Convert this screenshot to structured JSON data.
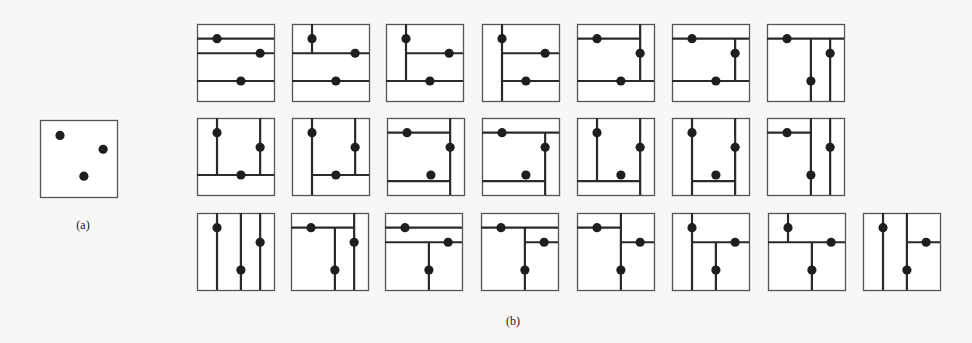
{
  "figure": {
    "panel_a": {
      "label": "(a)",
      "box": {
        "x": 40,
        "y": 120,
        "size": 77
      },
      "points": [
        [
          0.26,
          0.2
        ],
        [
          0.82,
          0.38
        ],
        [
          0.57,
          0.73
        ]
      ]
    },
    "panel_b": {
      "label": "(b)",
      "box_size": 77,
      "points": [
        [
          0.26,
          0.19
        ],
        [
          0.82,
          0.38
        ],
        [
          0.57,
          0.74
        ]
      ],
      "partitions": [
        {
          "x": 197,
          "y": 24,
          "lines": [
            [
              "h",
              0.19,
              0,
              1
            ],
            [
              "h",
              0.38,
              0,
              1
            ],
            [
              "h",
              0.74,
              0,
              1
            ]
          ]
        },
        {
          "x": 292,
          "y": 24,
          "lines": [
            [
              "v",
              0.26,
              0,
              0.38
            ],
            [
              "h",
              0.38,
              0,
              1
            ],
            [
              "h",
              0.74,
              0,
              1
            ]
          ]
        },
        {
          "x": 386,
          "y": 24,
          "lines": [
            [
              "v",
              0.26,
              0,
              0.74
            ],
            [
              "h",
              0.38,
              0.26,
              1
            ],
            [
              "h",
              0.74,
              0,
              1
            ]
          ]
        },
        {
          "x": 482,
          "y": 24,
          "lines": [
            [
              "v",
              0.26,
              0,
              1
            ],
            [
              "h",
              0.38,
              0.26,
              1
            ],
            [
              "h",
              0.74,
              0.26,
              1
            ]
          ]
        },
        {
          "x": 577,
          "y": 24,
          "lines": [
            [
              "h",
              0.19,
              0,
              0.82
            ],
            [
              "v",
              0.82,
              0,
              0.74
            ],
            [
              "h",
              0.74,
              0,
              1
            ]
          ]
        },
        {
          "x": 672,
          "y": 24,
          "lines": [
            [
              "h",
              0.19,
              0,
              1
            ],
            [
              "v",
              0.82,
              0.19,
              0.74
            ],
            [
              "h",
              0.74,
              0,
              1
            ]
          ]
        },
        {
          "x": 767,
          "y": 24,
          "lines": [
            [
              "h",
              0.19,
              0,
              1
            ],
            [
              "v",
              0.57,
              0.19,
              1
            ],
            [
              "v",
              0.82,
              0.19,
              1
            ]
          ]
        },
        {
          "x": 197,
          "y": 118,
          "lines": [
            [
              "v",
              0.26,
              0,
              0.74
            ],
            [
              "v",
              0.82,
              0,
              0.74
            ],
            [
              "h",
              0.74,
              0,
              1
            ]
          ]
        },
        {
          "x": 292,
          "y": 118,
          "lines": [
            [
              "v",
              0.26,
              0,
              1
            ],
            [
              "v",
              0.82,
              0,
              0.74
            ],
            [
              "h",
              0.74,
              0.26,
              1
            ]
          ]
        },
        {
          "x": 387,
          "y": 118,
          "lines": [
            [
              "h",
              0.19,
              0,
              0.82
            ],
            [
              "v",
              0.82,
              0,
              1
            ],
            [
              "h",
              0.82,
              0,
              0.82
            ]
          ]
        },
        {
          "x": 482,
          "y": 118,
          "lines": [
            [
              "h",
              0.19,
              0,
              1
            ],
            [
              "v",
              0.82,
              0.19,
              1
            ],
            [
              "h",
              0.82,
              0,
              0.82
            ]
          ]
        },
        {
          "x": 577,
          "y": 118,
          "lines": [
            [
              "v",
              0.26,
              0,
              0.82
            ],
            [
              "h",
              0.82,
              0,
              0.82
            ],
            [
              "v",
              0.82,
              0,
              1
            ]
          ]
        },
        {
          "x": 672,
          "y": 118,
          "lines": [
            [
              "v",
              0.26,
              0,
              1
            ],
            [
              "v",
              0.82,
              0,
              1
            ],
            [
              "h",
              0.82,
              0.26,
              0.82
            ]
          ]
        },
        {
          "x": 767,
          "y": 118,
          "lines": [
            [
              "h",
              0.19,
              0,
              0.57
            ],
            [
              "v",
              0.57,
              0,
              1
            ],
            [
              "v",
              0.82,
              0,
              1
            ]
          ]
        },
        {
          "x": 197,
          "y": 213,
          "lines": [
            [
              "v",
              0.26,
              0,
              1
            ],
            [
              "v",
              0.57,
              0,
              1
            ],
            [
              "v",
              0.82,
              0,
              1
            ]
          ]
        },
        {
          "x": 291,
          "y": 213,
          "lines": [
            [
              "h",
              0.19,
              0,
              0.82
            ],
            [
              "v",
              0.57,
              0.19,
              1
            ],
            [
              "v",
              0.82,
              0,
              1
            ]
          ]
        },
        {
          "x": 385,
          "y": 213,
          "lines": [
            [
              "h",
              0.19,
              0,
              1
            ],
            [
              "h",
              0.38,
              0,
              1
            ],
            [
              "v",
              0.57,
              0.38,
              1
            ]
          ]
        },
        {
          "x": 481,
          "y": 213,
          "lines": [
            [
              "h",
              0.19,
              0,
              1
            ],
            [
              "v",
              0.57,
              0.19,
              1
            ],
            [
              "h",
              0.38,
              0.57,
              1
            ]
          ]
        },
        {
          "x": 577,
          "y": 213,
          "lines": [
            [
              "h",
              0.19,
              0,
              0.57
            ],
            [
              "v",
              0.57,
              0,
              1
            ],
            [
              "h",
              0.38,
              0.57,
              1
            ]
          ]
        },
        {
          "x": 672,
          "y": 213,
          "lines": [
            [
              "v",
              0.26,
              0,
              1
            ],
            [
              "h",
              0.38,
              0.26,
              1
            ],
            [
              "v",
              0.57,
              0.38,
              1
            ]
          ]
        },
        {
          "x": 768,
          "y": 213,
          "lines": [
            [
              "v",
              0.26,
              0,
              0.38
            ],
            [
              "h",
              0.38,
              0,
              1
            ],
            [
              "v",
              0.57,
              0.38,
              1
            ]
          ]
        },
        {
          "x": 863,
          "y": 213,
          "lines": [
            [
              "v",
              0.26,
              0,
              1
            ],
            [
              "v",
              0.57,
              0,
              1
            ],
            [
              "h",
              0.38,
              0.57,
              1
            ]
          ]
        }
      ]
    }
  },
  "style": {
    "line_color": "#2a2a2a",
    "box_color": "#555555",
    "dot_color": "#1e1e1e"
  }
}
